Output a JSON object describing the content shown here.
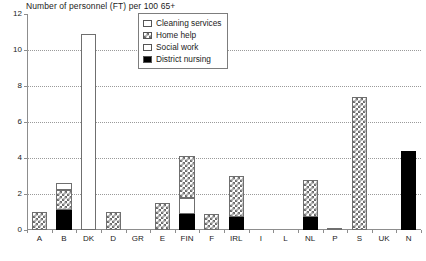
{
  "chart_data": {
    "type": "bar",
    "title": "Number of personnel (FT) per 100 65+",
    "subtitle": "",
    "xlabel": "",
    "ylabel": "",
    "ylim": [
      0,
      12
    ],
    "yticks": [
      0,
      2,
      4,
      6,
      8,
      10,
      12
    ],
    "ytick_labels": [
      "0",
      "2",
      "4",
      "6",
      "8",
      "10",
      "12"
    ],
    "grid": true,
    "stacked": true,
    "legend_position": "top-center",
    "categories": [
      "A",
      "B",
      "DK",
      "D",
      "GR",
      "E",
      "FIN",
      "F",
      "IRL",
      "I",
      "L",
      "NL",
      "P",
      "S",
      "UK",
      "N"
    ],
    "series": [
      {
        "name": "District nursing",
        "pattern": "solid-black",
        "values": [
          0.0,
          1.1,
          0.0,
          0.0,
          0.0,
          0.0,
          0.9,
          0.0,
          0.7,
          0.0,
          0.0,
          0.7,
          0.0,
          0.0,
          0.0,
          4.4
        ]
      },
      {
        "name": "Social work",
        "pattern": "white",
        "values": [
          0.0,
          0.0,
          0.0,
          0.0,
          0.0,
          0.0,
          0.9,
          0.0,
          0.0,
          0.0,
          0.0,
          0.0,
          0.0,
          0.0,
          0.0,
          0.0
        ]
      },
      {
        "name": "Home help",
        "pattern": "cross-hatch",
        "values": [
          1.0,
          1.1,
          0.0,
          1.0,
          0.0,
          1.5,
          2.3,
          0.9,
          2.3,
          0.0,
          0.0,
          2.1,
          0.1,
          7.4,
          0.0,
          0.0
        ]
      },
      {
        "name": "Cleaning services",
        "pattern": "white",
        "values": [
          0.0,
          0.4,
          10.9,
          0.0,
          0.0,
          0.0,
          0.0,
          0.0,
          0.0,
          0.0,
          0.0,
          0.0,
          0.0,
          0.0,
          0.0,
          0.0
        ]
      }
    ],
    "totals": [
      1.0,
      2.6,
      10.9,
      1.0,
      0.0,
      1.5,
      4.1,
      0.9,
      3.0,
      0.0,
      0.0,
      2.8,
      0.1,
      7.4,
      0.0,
      4.4
    ]
  },
  "legend": {
    "items": [
      {
        "label": "Cleaning services",
        "key": "white"
      },
      {
        "label": "Home help",
        "key": "cross-hatch"
      },
      {
        "label": "Social work",
        "key": "white"
      },
      {
        "label": "District nursing",
        "key": "solid-black"
      }
    ]
  },
  "colors": {
    "axis": "#8d8d8d",
    "grid": "#9a9a9a",
    "bar_outline": "#6f6f6f",
    "nursing_fill": "#000000",
    "hatch_fill": "#6b6b6b",
    "plot_background": "#ffffff",
    "text": "#1b1b1b"
  }
}
